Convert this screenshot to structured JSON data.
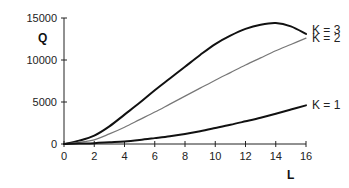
{
  "chart_data": {
    "type": "line",
    "title": "",
    "xlabel": "L",
    "ylabel": "Q",
    "xlim": [
      0,
      16
    ],
    "ylim": [
      0,
      15000
    ],
    "x_ticks": [
      0,
      2,
      4,
      6,
      8,
      10,
      12,
      14,
      16
    ],
    "y_ticks": [
      0,
      5000,
      10000,
      15000
    ],
    "grid": false,
    "legend_position": "inline-right",
    "x": [
      0,
      1,
      2,
      3,
      4,
      5,
      6,
      7,
      8,
      9,
      10,
      11,
      12,
      13,
      14,
      15,
      16
    ],
    "series": [
      {
        "name": "K = 3",
        "color": "#111111",
        "width": 2,
        "values": [
          0,
          400,
          1000,
          2100,
          3500,
          4900,
          6400,
          7800,
          9200,
          10600,
          11900,
          12900,
          13700,
          14200,
          14400,
          14000,
          13100
        ]
      },
      {
        "name": "K = 2",
        "color": "#777777",
        "width": 1.2,
        "values": [
          0,
          200,
          500,
          1200,
          2000,
          2900,
          3800,
          4750,
          5700,
          6650,
          7600,
          8500,
          9400,
          10250,
          11100,
          11850,
          12600
        ]
      },
      {
        "name": "K = 1",
        "color": "#111111",
        "width": 2,
        "values": [
          0,
          50,
          100,
          200,
          300,
          480,
          700,
          930,
          1200,
          1530,
          1900,
          2280,
          2700,
          3130,
          3600,
          4100,
          4600
        ]
      }
    ]
  },
  "axes": {
    "x_title": "L",
    "y_title": "Q"
  },
  "legend": [
    "K = 3",
    "K = 2",
    "K = 1"
  ]
}
